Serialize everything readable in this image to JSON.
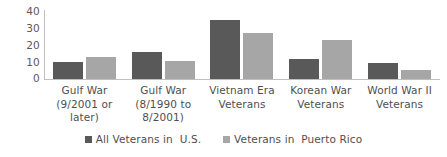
{
  "chart_data": {
    "type": "bar",
    "title": "",
    "subtitle": "",
    "xlabel": "",
    "ylabel": "",
    "ylim": [
      0,
      40
    ],
    "yticks": [
      40,
      30,
      20,
      10,
      0
    ],
    "grid": false,
    "legend_position": "bottom",
    "categories": [
      "Gulf War\n(9/2001 or\nlater)",
      "Gulf  War\n(8/1990 to\n8/2001)",
      "Vietnam Era\nVeterans",
      "Korean War\nVeterans",
      "World War II\nVeterans"
    ],
    "series": [
      {
        "name": "All Veterans in  U.S.",
        "color": "#595959",
        "values": [
          10,
          16,
          35,
          12,
          9.5
        ]
      },
      {
        "name": "Veterans in  Puerto Rico",
        "color": "#a6a6a6",
        "values": [
          13,
          10.5,
          27,
          23,
          5.5
        ]
      }
    ]
  },
  "legend": {
    "items": [
      {
        "label": "All Veterans in  U.S.",
        "swatch": "legend-swatch-dark"
      },
      {
        "label": "Veterans in  Puerto Rico",
        "swatch": "legend-swatch-light"
      }
    ]
  },
  "axis": {
    "y_tick_labels": [
      "40",
      "30",
      "20",
      "10",
      "0"
    ]
  },
  "colors": {
    "series_us": "#595959",
    "series_pr": "#a6a6a6",
    "axis": "#bfbfbf",
    "text": "#4f4f4f",
    "background": "#ffffff"
  }
}
